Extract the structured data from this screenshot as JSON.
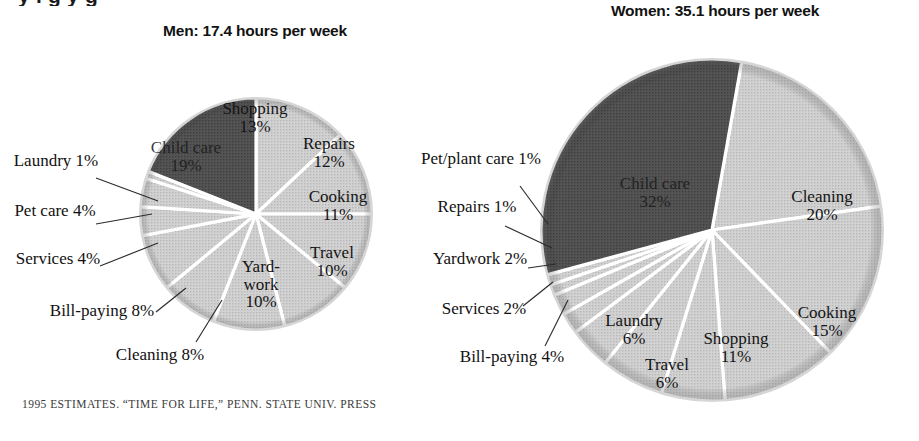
{
  "headline_fragment": "y    l      g  y      g",
  "source_note": {
    "year": "1995",
    "text": "ESTIMATES. “TIME FOR LIFE,” PENN. STATE UNIV. PRESS",
    "full": "1995 ESTIMATES. “TIME FOR LIFE,” PENN. STATE UNIV. PRESS"
  },
  "colors": {
    "dark_slice": "#4d4d4d",
    "light_slice": "#c9c9c9",
    "pale_slice": "#d9d9d9",
    "divider": "#ffffff",
    "text": "#111111"
  },
  "chart_data": [
    {
      "type": "pie",
      "title": "Men: 17.4 hours per week",
      "subject": "Men",
      "total_hours_per_week": 17.4,
      "unit": "%",
      "legend": "none",
      "categories": [
        "Child care",
        "Shopping",
        "Repairs",
        "Cooking",
        "Travel",
        "Yard-work",
        "Cleaning",
        "Bill-paying",
        "Services",
        "Pet care",
        "Laundry"
      ],
      "values": [
        19,
        13,
        12,
        11,
        10,
        10,
        8,
        8,
        4,
        4,
        1
      ],
      "labels": [
        {
          "name": "Child care",
          "pct": "19%",
          "placement": "inside",
          "highlight": true
        },
        {
          "name": "Shopping",
          "pct": "13%",
          "placement": "inside",
          "highlight": false
        },
        {
          "name": "Repairs",
          "pct": "12%",
          "placement": "inside",
          "highlight": false
        },
        {
          "name": "Cooking",
          "pct": "11%",
          "placement": "inside",
          "highlight": false
        },
        {
          "name": "Travel",
          "pct": "10%",
          "placement": "inside",
          "highlight": false
        },
        {
          "name": "Yard-\nwork",
          "pct": "10%",
          "placement": "inside",
          "highlight": false
        },
        {
          "name": "Cleaning",
          "pct": "8%",
          "placement": "outside",
          "highlight": false
        },
        {
          "name": "Bill-paying",
          "pct": "8%",
          "placement": "outside",
          "highlight": false
        },
        {
          "name": "Services",
          "pct": "4%",
          "placement": "outside",
          "highlight": false
        },
        {
          "name": "Pet care",
          "pct": "4%",
          "placement": "outside",
          "highlight": false
        },
        {
          "name": "Laundry",
          "pct": "1%",
          "placement": "outside",
          "highlight": false
        }
      ]
    },
    {
      "type": "pie",
      "title": "Women: 35.1 hours per week",
      "subject": "Women",
      "total_hours_per_week": 35.1,
      "unit": "%",
      "legend": "none",
      "categories": [
        "Child care",
        "Cleaning",
        "Cooking",
        "Shopping",
        "Travel",
        "Laundry",
        "Bill-paying",
        "Services",
        "Yardwork",
        "Repairs",
        "Pet/plant care"
      ],
      "values": [
        32,
        20,
        15,
        11,
        6,
        6,
        4,
        2,
        2,
        1,
        1
      ],
      "labels": [
        {
          "name": "Child care",
          "pct": "32%",
          "placement": "inside",
          "highlight": true
        },
        {
          "name": "Cleaning",
          "pct": "20%",
          "placement": "inside",
          "highlight": false
        },
        {
          "name": "Cooking",
          "pct": "15%",
          "placement": "inside",
          "highlight": false
        },
        {
          "name": "Shopping",
          "pct": "11%",
          "placement": "inside",
          "highlight": false
        },
        {
          "name": "Travel",
          "pct": "6%",
          "placement": "inside",
          "highlight": false
        },
        {
          "name": "Laundry",
          "pct": "6%",
          "placement": "inside",
          "highlight": false
        },
        {
          "name": "Bill-paying",
          "pct": "4%",
          "placement": "outside",
          "highlight": false
        },
        {
          "name": "Services",
          "pct": "2%",
          "placement": "outside",
          "highlight": false
        },
        {
          "name": "Yardwork",
          "pct": "2%",
          "placement": "outside",
          "highlight": false
        },
        {
          "name": "Repairs",
          "pct": "1%",
          "placement": "outside",
          "highlight": false
        },
        {
          "name": "Pet/plant care",
          "pct": "1%",
          "placement": "outside",
          "highlight": false
        }
      ]
    }
  ],
  "men": {
    "title": "Men: 17.4 hours per week",
    "inside": {
      "child_care": "Child care",
      "child_care_pct": "19%",
      "shopping": "Shopping",
      "shopping_pct": "13%",
      "repairs": "Repairs",
      "repairs_pct": "12%",
      "cooking": "Cooking",
      "cooking_pct": "11%",
      "travel": "Travel",
      "travel_pct": "10%",
      "yardwork_l1": "Yard-",
      "yardwork_l2": "work",
      "yardwork_pct": "10%"
    },
    "outside": {
      "laundry": "Laundry",
      "laundry_pct": "1%",
      "pet_care": "Pet care",
      "pet_care_pct": "4%",
      "services": "Services",
      "services_pct": "4%",
      "bill_paying": "Bill-paying",
      "bill_paying_pct": "8%",
      "cleaning": "Cleaning",
      "cleaning_pct": "8%"
    }
  },
  "women": {
    "title": "Women: 35.1 hours per week",
    "inside": {
      "child_care": "Child care",
      "child_care_pct": "32%",
      "cleaning": "Cleaning",
      "cleaning_pct": "20%",
      "cooking": "Cooking",
      "cooking_pct": "15%",
      "shopping": "Shopping",
      "shopping_pct": "11%",
      "laundry": "Laundry",
      "laundry_pct": "6%",
      "travel": "Travel",
      "travel_pct": "6%"
    },
    "outside": {
      "pet_plant_l1": "Pet/plant",
      "pet_plant_l2": "care 1%",
      "repairs": "Repairs",
      "repairs_pct": "1%",
      "yardwork": "Yardwork",
      "yardwork_pct": "2%",
      "services": "Services",
      "services_pct": "2%",
      "bill_paying": "Bill-paying",
      "bill_paying_pct": "4%"
    }
  }
}
